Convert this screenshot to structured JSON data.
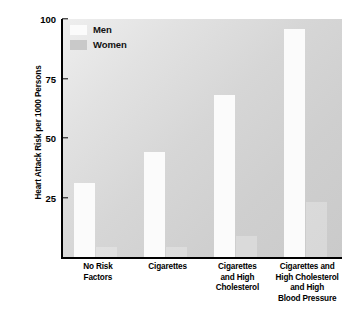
{
  "chart_data": {
    "type": "bar",
    "title": "",
    "xlabel": "",
    "ylabel": "Heart Attack Risk per 1000 Persons",
    "ylim": [
      0,
      100
    ],
    "yticks": [
      25,
      50,
      75,
      100
    ],
    "grid": false,
    "legend_position": "top-left",
    "categories": [
      "No Risk\nFactors",
      "Cigarettes",
      "Cigarettes\nand High\nCholesterol",
      "Cigarettes and\nHigh Cholesterol\nand High\nBlood Pressure"
    ],
    "series": [
      {
        "name": "Men",
        "values": [
          31,
          44,
          68,
          96
        ],
        "color": "#fbfbfb"
      },
      {
        "name": "Women",
        "values": [
          4,
          4,
          9,
          23
        ],
        "color": "#c9c9c9"
      }
    ]
  },
  "axis": {
    "y_title": "Heart Attack Risk per 1000 Persons",
    "y_tick_labels": [
      "100",
      "75",
      "50",
      "25"
    ]
  },
  "legend": {
    "items": [
      {
        "label": "Men"
      },
      {
        "label": "Women"
      }
    ]
  },
  "categories_display": [
    {
      "lines": [
        "No Risk",
        "Factors"
      ]
    },
    {
      "lines": [
        "Cigarettes"
      ]
    },
    {
      "lines": [
        "Cigarettes",
        "and High",
        "Cholesterol"
      ]
    },
    {
      "lines": [
        "Cigarettes and",
        "High Cholesterol",
        "and High",
        "Blood Pressure"
      ]
    }
  ]
}
